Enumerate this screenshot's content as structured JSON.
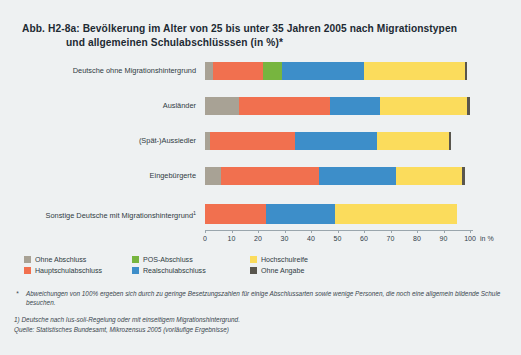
{
  "figure": {
    "title_line1": "Abb. H2-8a: Bevölkerung im Alter von 25 bis unter 35 Jahren 2005 nach Migrationstypen",
    "title_line2": "und allgemeinen Schulabschlüsssen (in %)*"
  },
  "axis": {
    "unit": "in %",
    "ticks": [
      "0",
      "10",
      "20",
      "30",
      "40",
      "50",
      "60",
      "70",
      "80",
      "90",
      "100"
    ]
  },
  "legend": [
    {
      "label": "Ohne Abschluss",
      "color": "#a8a295"
    },
    {
      "label": "Hauptschulabschluss",
      "color": "#f1704f"
    },
    {
      "label": "POS-Abschluss",
      "color": "#77b53f"
    },
    {
      "label": "Realschulabschluss",
      "color": "#3d8ec9"
    },
    {
      "label": "Hochschulreife",
      "color": "#fbdc5c"
    },
    {
      "label": "Ohne Angabe",
      "color": "#59564e"
    }
  ],
  "notes": {
    "star_marker": "*",
    "star_text": "Abweichungen von 100% ergeben sich durch zu geringe Besetzungszahlen für einige Abschlussarten sowie wenige Personen, die noch eine allgemein bildende Schule besuchen.",
    "note_1": "1) Deutsche nach Ius-soli-Regelung oder mit einseitigem Migrationshintergrund.",
    "source": "Quelle: Statistisches Bundesamt, Mikrozensus 2005 (vorläufige Ergebnisse)"
  },
  "chart_data": {
    "type": "bar",
    "orientation": "horizontal",
    "stacked": true,
    "title": "Abb. H2-8a: Bevölkerung im Alter von 25 bis unter 35 Jahren 2005 nach Migrationstypen und allgemeinen Schulabschlüsssen (in %)*",
    "xlabel": "in %",
    "ylabel": "",
    "xlim": [
      0,
      100
    ],
    "xticks": [
      0,
      10,
      20,
      30,
      40,
      50,
      60,
      70,
      80,
      90,
      100
    ],
    "grid": false,
    "legend_position": "below-axis",
    "categories": [
      "Deutsche ohne Migrationshintergrund",
      "Ausländer",
      "(Spät-)Aussiedler",
      "Eingebürgerte",
      "Sonstige Deutsche mit Migrationshintergrund¹"
    ],
    "series": [
      {
        "name": "Ohne Abschluss",
        "color": "#a8a295",
        "values": [
          3,
          13,
          2,
          6,
          0
        ]
      },
      {
        "name": "Hauptschulabschluss",
        "color": "#f1704f",
        "values": [
          19,
          34,
          32,
          37,
          23
        ]
      },
      {
        "name": "POS-Abschluss",
        "color": "#77b53f",
        "values": [
          7,
          0,
          0,
          0,
          0
        ]
      },
      {
        "name": "Realschulabschluss",
        "color": "#3d8ec9",
        "values": [
          31,
          19,
          31,
          29,
          26
        ]
      },
      {
        "name": "Hochschulreife",
        "color": "#fbdc5c",
        "values": [
          38,
          33,
          27,
          25,
          46
        ]
      },
      {
        "name": "Ohne Angabe",
        "color": "#59564e",
        "values": [
          1,
          1,
          1,
          1,
          0
        ]
      }
    ]
  }
}
